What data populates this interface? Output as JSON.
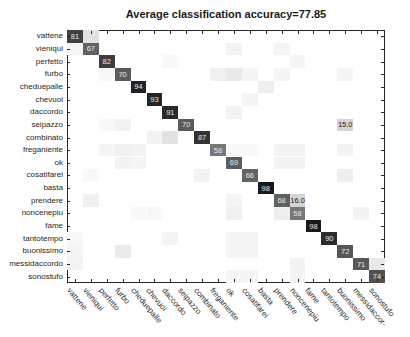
{
  "chart_data": {
    "type": "heatmap",
    "title": "Average classification accuracy=77.85",
    "xlabel": "",
    "ylabel": "",
    "labels": [
      "vattene",
      "vieniqui",
      "perfetto",
      "furbo",
      "cheduepalle",
      "chevuoi",
      "daccordo",
      "seipazzo",
      "combinato",
      "freganiente",
      "ok",
      "cosatifarei",
      "basta",
      "prendere",
      "noncenepiu",
      "fame",
      "tantotempo",
      "buonissimo",
      "messidaccordo",
      "sonostufo"
    ],
    "diagonal": [
      81,
      67,
      82,
      70,
      94,
      93,
      91,
      70,
      87,
      58,
      69,
      66,
      98,
      68,
      58,
      98,
      90,
      72,
      71,
      74
    ],
    "annotated_offdiagonal": [
      {
        "row": "seipazzo",
        "col": "buonissimo",
        "value": 15.0
      },
      {
        "row": "prendere",
        "col": "noncenepiu",
        "value": 16.0
      }
    ],
    "faint_offdiagonal": [
      {
        "row": 0,
        "col": 1,
        "value": 12
      },
      {
        "row": 1,
        "col": 0,
        "value": 4
      },
      {
        "row": 1,
        "col": 10,
        "value": 5
      },
      {
        "row": 1,
        "col": 13,
        "value": 4
      },
      {
        "row": 2,
        "col": 6,
        "value": 3
      },
      {
        "row": 2,
        "col": 14,
        "value": 4
      },
      {
        "row": 3,
        "col": 2,
        "value": 3
      },
      {
        "row": 3,
        "col": 9,
        "value": 6
      },
      {
        "row": 3,
        "col": 10,
        "value": 9
      },
      {
        "row": 3,
        "col": 11,
        "value": 4
      },
      {
        "row": 3,
        "col": 13,
        "value": 4
      },
      {
        "row": 3,
        "col": 17,
        "value": 4
      },
      {
        "row": 4,
        "col": 12,
        "value": 7
      },
      {
        "row": 5,
        "col": 11,
        "value": 4
      },
      {
        "row": 6,
        "col": 10,
        "value": 5
      },
      {
        "row": 7,
        "col": 2,
        "value": 3
      },
      {
        "row": 7,
        "col": 3,
        "value": 5
      },
      {
        "row": 7,
        "col": 17,
        "value": 15
      },
      {
        "row": 8,
        "col": 5,
        "value": 5
      },
      {
        "row": 8,
        "col": 6,
        "value": 12
      },
      {
        "row": 9,
        "col": 2,
        "value": 4
      },
      {
        "row": 9,
        "col": 3,
        "value": 6
      },
      {
        "row": 9,
        "col": 4,
        "value": 5
      },
      {
        "row": 9,
        "col": 10,
        "value": 3
      },
      {
        "row": 9,
        "col": 11,
        "value": 3
      },
      {
        "row": 9,
        "col": 13,
        "value": 5
      },
      {
        "row": 9,
        "col": 14,
        "value": 5
      },
      {
        "row": 9,
        "col": 17,
        "value": 5
      },
      {
        "row": 10,
        "col": 3,
        "value": 5
      },
      {
        "row": 10,
        "col": 4,
        "value": 4
      },
      {
        "row": 10,
        "col": 13,
        "value": 5
      },
      {
        "row": 10,
        "col": 14,
        "value": 5
      },
      {
        "row": 11,
        "col": 1,
        "value": 3
      },
      {
        "row": 11,
        "col": 8,
        "value": 5
      },
      {
        "row": 11,
        "col": 17,
        "value": 7
      },
      {
        "row": 13,
        "col": 1,
        "value": 6
      },
      {
        "row": 13,
        "col": 10,
        "value": 4
      },
      {
        "row": 13,
        "col": 14,
        "value": 16
      },
      {
        "row": 14,
        "col": 4,
        "value": 3
      },
      {
        "row": 14,
        "col": 5,
        "value": 3
      },
      {
        "row": 14,
        "col": 10,
        "value": 6
      },
      {
        "row": 14,
        "col": 13,
        "value": 7
      },
      {
        "row": 14,
        "col": 18,
        "value": 5
      },
      {
        "row": 16,
        "col": 0,
        "value": 3
      },
      {
        "row": 16,
        "col": 6,
        "value": 4
      },
      {
        "row": 16,
        "col": 10,
        "value": 4
      },
      {
        "row": 16,
        "col": 11,
        "value": 4
      },
      {
        "row": 16,
        "col": 16,
        "value": 4
      },
      {
        "row": 17,
        "col": 0,
        "value": 4
      },
      {
        "row": 17,
        "col": 3,
        "value": 8
      },
      {
        "row": 17,
        "col": 10,
        "value": 4
      },
      {
        "row": 17,
        "col": 11,
        "value": 4
      },
      {
        "row": 17,
        "col": 17,
        "value": 4
      },
      {
        "row": 18,
        "col": 0,
        "value": 5
      },
      {
        "row": 18,
        "col": 14,
        "value": 5
      },
      {
        "row": 18,
        "col": 19,
        "value": 9
      },
      {
        "row": 19,
        "col": 10,
        "value": 4
      },
      {
        "row": 19,
        "col": 11,
        "value": 4
      },
      {
        "row": 19,
        "col": 14,
        "value": 5
      }
    ],
    "colormap": "grayscale (white = 0, black = 100)",
    "grid": false,
    "legend": "none"
  },
  "xtick_labels_display": [
    "vattene",
    "vieniqui",
    "perfetto",
    "furbo",
    "cheduepalle",
    "chevuoi",
    "daccordo",
    "seipazzo",
    "combinato",
    "freganiente",
    "ok",
    "cosatifarei",
    "basta",
    "prendere",
    "noncenepiu",
    "fame",
    "tantotempo",
    "buonissimo",
    "messidaccor-",
    "sonostufo"
  ]
}
